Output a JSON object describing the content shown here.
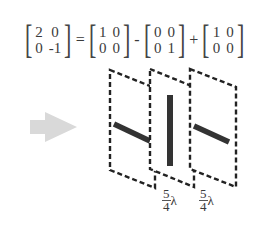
{
  "equation": {
    "lhs": {
      "cells": [
        "2",
        "0",
        "0",
        "-1"
      ]
    },
    "ops": [
      "=",
      "-",
      "+"
    ],
    "rhs": [
      {
        "cells": [
          "1",
          "0",
          "0",
          "0"
        ]
      },
      {
        "cells": [
          "0",
          "0",
          "0",
          "1"
        ]
      },
      {
        "cells": [
          "1",
          "0",
          "0",
          "0"
        ]
      }
    ]
  },
  "arrow": {
    "color": "#d8d8d8",
    "direction": "right"
  },
  "plates": [
    {
      "bar": "diagonal"
    },
    {
      "bar": "vertical"
    },
    {
      "bar": "diagonal"
    }
  ],
  "spacing_labels": [
    {
      "numerator": "5",
      "denominator": "4",
      "symbol": "λ"
    },
    {
      "numerator": "5",
      "denominator": "4",
      "symbol": "λ"
    }
  ],
  "colors": {
    "dashed_outline": "#222222",
    "bar": "#333333"
  }
}
